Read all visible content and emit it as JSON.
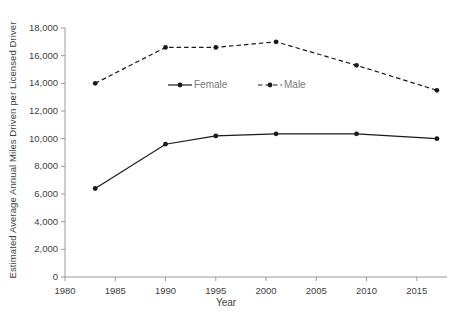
{
  "chart_data": {
    "type": "line",
    "title": "",
    "xlabel": "Year",
    "ylabel": "Estimated Average Annual Miles Driven per Licensed Driver",
    "xlim": [
      1980,
      2018
    ],
    "ylim": [
      0,
      18000
    ],
    "xticks": [
      1980,
      1985,
      1990,
      1995,
      2000,
      2005,
      2010,
      2015
    ],
    "xtick_labels": [
      "1980",
      "1985",
      "1990",
      "1995",
      "2000",
      "2005",
      "2010",
      "2015"
    ],
    "yticks": [
      0,
      2000,
      4000,
      6000,
      8000,
      10000,
      12000,
      14000,
      16000,
      18000
    ],
    "ytick_labels": [
      "0",
      "2,000",
      "4,000",
      "6,000",
      "8,000",
      "10,000",
      "12,000",
      "14,000",
      "16,000",
      "18,000"
    ],
    "grid": false,
    "legend_position": "inside-upper-center",
    "x": [
      1983,
      1990,
      1995,
      2001,
      2009,
      2017
    ],
    "series": [
      {
        "name": "Female",
        "style": "solid",
        "marker": "filled-circle",
        "color": "#1a1a1a",
        "values": [
          6400,
          9600,
          10200,
          10350,
          10350,
          10000
        ]
      },
      {
        "name": "Male",
        "style": "dashed",
        "marker": "filled-circle",
        "color": "#1a1a1a",
        "values": [
          14000,
          16600,
          16600,
          17000,
          15300,
          13500
        ]
      }
    ]
  },
  "legend": {
    "items": [
      {
        "label": "Female",
        "style": "solid"
      },
      {
        "label": "Male",
        "style": "dashed"
      }
    ]
  },
  "axes": {
    "x_title": "Year",
    "y_title": "Estimated Average Annual Miles Driven per Licensed Driver"
  }
}
